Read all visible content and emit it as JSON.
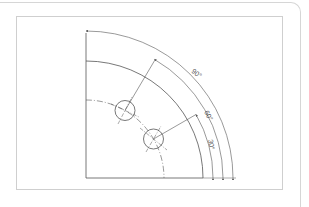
{
  "diagram": {
    "type": "engineering-drawing",
    "center": {
      "x": 86,
      "y": 178
    },
    "radii": {
      "bolt_circle": 78,
      "outer_edge": 117,
      "dim_30": 127,
      "dim_60": 137,
      "dim_90": 147
    },
    "hole_radius": 10,
    "holes": [
      {
        "angle_deg": 30
      },
      {
        "angle_deg": 60
      }
    ],
    "dimensions": [
      {
        "label": "90°",
        "angle_deg": 90
      },
      {
        "label": "60°",
        "angle_deg": 60
      },
      {
        "label": "30°",
        "angle_deg": 30
      }
    ],
    "colors": {
      "line": "#555555",
      "frame": "#cfcfcf",
      "panel": "#d6d6d6"
    }
  }
}
